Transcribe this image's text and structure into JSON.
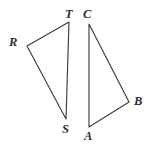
{
  "figure": {
    "type": "geometry-diagram",
    "background_color": "#ffffff",
    "stroke_color": "#3b3b44",
    "label_color": "#2e2e36",
    "width": 151,
    "height": 149,
    "shapes": [
      {
        "name": "triangle-rst",
        "vertex_order": "T,R,S",
        "points": "69,22 27,46 66,119",
        "closed": true
      },
      {
        "name": "triangle-abc",
        "vertex_order": "C,B,A",
        "points": "89,24 129,102 89,127",
        "closed": true
      }
    ],
    "labels": [
      {
        "id": "T",
        "text": "T",
        "x": 65,
        "y": 8,
        "shape": "triangle-rst"
      },
      {
        "id": "R",
        "text": "R",
        "x": 9,
        "y": 36,
        "shape": "triangle-rst"
      },
      {
        "id": "S",
        "text": "S",
        "x": 62,
        "y": 123,
        "shape": "triangle-rst"
      },
      {
        "id": "C",
        "text": "C",
        "x": 83,
        "y": 8,
        "shape": "triangle-abc"
      },
      {
        "id": "B",
        "text": "B",
        "x": 134,
        "y": 95,
        "shape": "triangle-abc"
      },
      {
        "id": "A",
        "text": "A",
        "x": 84,
        "y": 130,
        "shape": "triangle-abc"
      }
    ]
  }
}
